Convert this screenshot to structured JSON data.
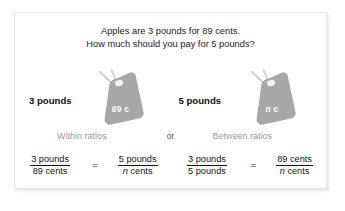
{
  "card": {
    "prompt_line1": "Apples are 3 pounds for 89 cents.",
    "prompt_line2": "How much should you pay for 5 pounds?",
    "or_label": "or"
  },
  "left_panel": {
    "pounds_label": "3 pounds",
    "tag_value": "89",
    "tag_unit": "c",
    "ratio_caption": "Within ratios",
    "equation": {
      "left_fraction": {
        "numerator": "3 pounds",
        "denominator": "89 cents"
      },
      "operator": "=",
      "right_fraction": {
        "numerator": "5 pounds",
        "denominator_var": "n",
        "denominator_unit": "cents"
      }
    }
  },
  "right_panel": {
    "pounds_label": "5 pounds",
    "tag_value_var": "n",
    "tag_unit": "c",
    "ratio_caption": "Between ratios",
    "equation": {
      "left_fraction": {
        "numerator": "3 pounds",
        "denominator": "5 pounds"
      },
      "operator": "=",
      "right_fraction": {
        "numerator": "89 cents",
        "denominator_var": "n",
        "denominator_unit": "cents"
      }
    }
  },
  "colors": {
    "tag_fill": "#a8a8a8",
    "tag_stroke": "#8f8f8f",
    "caption_gray": "#9d9d9d",
    "text_dark": "#131313",
    "card_bg": "#ffffff"
  }
}
